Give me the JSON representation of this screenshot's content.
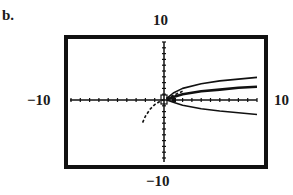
{
  "part_label": "b.",
  "chart_data": {
    "type": "line",
    "title": "",
    "xlabel": "",
    "ylabel": "",
    "xlim": [
      -10,
      10
    ],
    "ylim": [
      -10,
      10
    ],
    "window_labels": {
      "top": "10",
      "bottom": "-10",
      "left": "-10",
      "right": "10"
    },
    "grid": false,
    "tick_step": 1,
    "series": [
      {
        "name": "upper curve",
        "style": "solid",
        "x": [
          0.3,
          1,
          2,
          4,
          6,
          8,
          10
        ],
        "y": [
          0.3,
          1.2,
          2.0,
          2.8,
          3.3,
          3.6,
          3.9
        ]
      },
      {
        "name": "middle curve",
        "style": "solid-bold",
        "x": [
          0.3,
          1,
          2,
          4,
          6,
          8,
          10
        ],
        "y": [
          0.1,
          0.5,
          1.0,
          1.5,
          1.8,
          2.1,
          2.3
        ]
      },
      {
        "name": "lower curve",
        "style": "solid",
        "x": [
          0.3,
          1,
          2,
          4,
          6,
          8,
          10
        ],
        "y": [
          0.0,
          -0.4,
          -0.9,
          -1.5,
          -1.9,
          -2.2,
          -2.5
        ]
      },
      {
        "name": "dashed curve",
        "style": "dashed",
        "x": [
          -2.3,
          -2.0,
          -1.5,
          -1.0,
          -0.5,
          0,
          1,
          2
        ],
        "y": [
          -3.9,
          -2.8,
          -1.6,
          -0.8,
          -0.3,
          0.1,
          0.8,
          1.5
        ]
      }
    ]
  },
  "colors": {
    "ink": "#111111",
    "background": "#ffffff"
  }
}
